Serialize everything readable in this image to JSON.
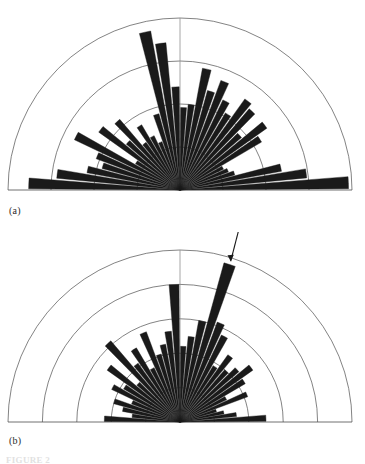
{
  "figure": {
    "type": "figure-with-two-rose-diagrams",
    "background": "#ffffff",
    "ink_color": "#1a1a1a",
    "grid_color": "#4d4d4d",
    "caption_stub": "FIGURE 2"
  },
  "panels": [
    {
      "id": "a",
      "label": "(a)",
      "ring_count": 4,
      "has_arrow": false
    },
    {
      "id": "b",
      "label": "(b)",
      "ring_count": 5,
      "has_arrow": true,
      "arrow_name": "down-arrow-annotation"
    }
  ],
  "chart_data": [
    {
      "type": "bar",
      "subtype": "rose-diagram",
      "panel": "a",
      "title": "",
      "xlabel": "",
      "ylabel": "",
      "angular_units": "degrees",
      "angular_range": [
        0,
        180
      ],
      "angular_note": "Half rose (upper semicircle); 0 deg at right along baseline, 180 deg at left",
      "bin_width_deg": 5,
      "radial_axis": {
        "rings": 4,
        "ring_radii_fraction": [
          0.25,
          0.5,
          0.75,
          1.0
        ],
        "rmax_px": 172,
        "grid": true
      },
      "legend": {
        "entries": [],
        "position": "none"
      },
      "categories": [
        2.5,
        7.5,
        12.5,
        17.5,
        22.5,
        27.5,
        32.5,
        37.5,
        42.5,
        47.5,
        52.5,
        57.5,
        62.5,
        67.5,
        72.5,
        77.5,
        82.5,
        87.5,
        92.5,
        97.5,
        102.5,
        107.5,
        112.5,
        117.5,
        122.5,
        127.5,
        132.5,
        137.5,
        142.5,
        147.5,
        152.5,
        157.5,
        162.5,
        167.5,
        172.5,
        177.5
      ],
      "values": [
        0.98,
        0.74,
        0.6,
        0.33,
        0.3,
        0.28,
        0.55,
        0.62,
        0.47,
        0.62,
        0.65,
        0.52,
        0.58,
        0.68,
        0.6,
        0.72,
        0.5,
        0.48,
        0.6,
        0.86,
        0.94,
        0.46,
        0.3,
        0.35,
        0.44,
        0.34,
        0.54,
        0.41,
        0.58,
        0.3,
        0.68,
        0.52,
        0.47,
        0.55,
        0.72,
        0.88
      ],
      "value_units": "fraction of outer ring radius",
      "ylim": [
        0,
        1
      ]
    },
    {
      "type": "bar",
      "subtype": "rose-diagram",
      "panel": "b",
      "title": "",
      "xlabel": "",
      "ylabel": "",
      "angular_units": "degrees",
      "angular_range": [
        0,
        180
      ],
      "angular_note": "Half rose (upper semicircle); 0 deg at right along baseline, 180 deg at left",
      "bin_width_deg": 5,
      "radial_axis": {
        "rings": 5,
        "ring_radii_fraction": [
          0.2,
          0.4,
          0.6,
          0.8,
          1.0
        ],
        "rmax_px": 172,
        "grid": true
      },
      "legend": {
        "entries": [],
        "position": "none"
      },
      "annotations": [
        {
          "name": "peak-arrow",
          "glyph": "down-arrow",
          "at_angle_deg": 72.5,
          "note": "arrow marks the tallest petal"
        }
      ],
      "categories": [
        2.5,
        7.5,
        12.5,
        17.5,
        22.5,
        27.5,
        32.5,
        37.5,
        42.5,
        47.5,
        52.5,
        57.5,
        62.5,
        67.5,
        72.5,
        77.5,
        82.5,
        87.5,
        92.5,
        97.5,
        102.5,
        107.5,
        112.5,
        117.5,
        122.5,
        127.5,
        132.5,
        137.5,
        142.5,
        147.5,
        152.5,
        157.5,
        162.5,
        167.5,
        172.5,
        177.5
      ],
      "values": [
        0.5,
        0.33,
        0.26,
        0.22,
        0.42,
        0.3,
        0.44,
        0.52,
        0.45,
        0.4,
        0.48,
        0.38,
        0.56,
        0.62,
        0.96,
        0.6,
        0.5,
        0.44,
        0.8,
        0.53,
        0.46,
        0.41,
        0.56,
        0.35,
        0.5,
        0.42,
        0.62,
        0.33,
        0.52,
        0.38,
        0.44,
        0.3,
        0.4,
        0.34,
        0.28,
        0.44
      ],
      "value_units": "fraction of outer ring radius",
      "ylim": [
        0,
        1
      ]
    }
  ]
}
